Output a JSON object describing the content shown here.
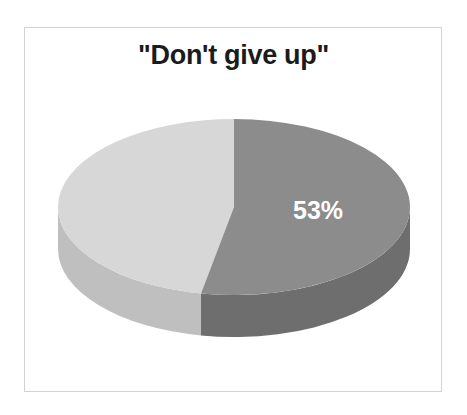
{
  "figure": {
    "background_color": "#ffffff",
    "frame_color": "#d2d2d2",
    "title": "\"Don't give up\""
  },
  "chart_data": {
    "type": "pie",
    "title": "\"Don't give up\"",
    "subtitle": "",
    "xlabel": "",
    "ylabel": "",
    "three_d": true,
    "legend": "none",
    "grid": false,
    "start_angle_deg": 0,
    "direction": "clockwise",
    "categories": [
      "53%",
      "47%"
    ],
    "values": [
      53,
      47
    ],
    "labels_shown": [
      "53%"
    ],
    "slices": [
      {
        "label": "53%",
        "value": 53,
        "percent": 53,
        "top_color": "#8c8c8c",
        "side_color": "#6e6e6e",
        "label_color": "#ffffff",
        "label_visible": true
      },
      {
        "label": "47%",
        "value": 47,
        "percent": 47,
        "top_color": "#d7d7d7",
        "side_color": "#bfbfbf",
        "label_color": "#ffffff",
        "label_visible": false
      }
    ],
    "geometry": {
      "center_x": 234,
      "center_y": 207,
      "radius_x": 176,
      "radius_y": 88,
      "depth": 42
    }
  }
}
